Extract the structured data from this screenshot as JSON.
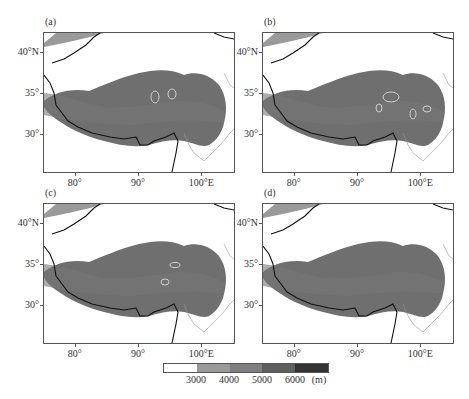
{
  "figure": {
    "panels": [
      {
        "id": "a",
        "label": "(a)",
        "ellipses": [
          {
            "cx": 111,
            "cy": 64,
            "rx": 4,
            "ry": 6
          },
          {
            "cx": 128,
            "cy": 61,
            "rx": 4,
            "ry": 5
          }
        ]
      },
      {
        "id": "b",
        "label": "(b)",
        "ellipses": [
          {
            "cx": 128,
            "cy": 64,
            "rx": 8,
            "ry": 5
          },
          {
            "cx": 116,
            "cy": 75,
            "rx": 3,
            "ry": 4
          },
          {
            "cx": 150,
            "cy": 81,
            "rx": 3,
            "ry": 5
          },
          {
            "cx": 164,
            "cy": 76,
            "rx": 4,
            "ry": 3
          }
        ]
      },
      {
        "id": "c",
        "label": "(c)",
        "ellipses": [
          {
            "cx": 131,
            "cy": 61,
            "rx": 5,
            "ry": 2.5
          },
          {
            "cx": 121,
            "cy": 78,
            "rx": 4,
            "ry": 3
          }
        ]
      },
      {
        "id": "d",
        "label": "(d)",
        "ellipses": []
      }
    ],
    "y_ticks": [
      {
        "label": "40°N",
        "lat": 40
      },
      {
        "label": "35°",
        "lat": 35
      },
      {
        "label": "30°",
        "lat": 30
      }
    ],
    "x_ticks": [
      {
        "label": "80°",
        "lon": 80
      },
      {
        "label": "90°",
        "lon": 90
      },
      {
        "label": "100°E",
        "lon": 100
      }
    ],
    "colorbar": {
      "ticks": [
        "3000",
        "4000",
        "5000",
        "6000"
      ],
      "unit": "(m)",
      "colors": [
        "#ffffff",
        "#9a9a9a",
        "#7f7f7f",
        "#5f5f5f",
        "#333333"
      ]
    }
  },
  "chart_data": {
    "type": "heatmap",
    "panels": [
      "(a)",
      "(b)",
      "(c)",
      "(d)"
    ],
    "xlabel": "Longitude",
    "ylabel": "Latitude",
    "x_ticks": [
      "80°",
      "90°",
      "100°E"
    ],
    "y_ticks": [
      "30°",
      "35°",
      "40°N"
    ],
    "xlim": [
      75,
      105
    ],
    "ylim": [
      25.5,
      42.5
    ],
    "colorbar": {
      "label": "(m)",
      "bounds": [
        3000,
        4000,
        5000,
        6000
      ],
      "levels": [
        "<3000",
        "3000-4000",
        "4000-5000",
        "5000-6000",
        ">6000"
      ]
    },
    "annotations": "Gray ellipses highlight regions on panels a, b, c"
  }
}
